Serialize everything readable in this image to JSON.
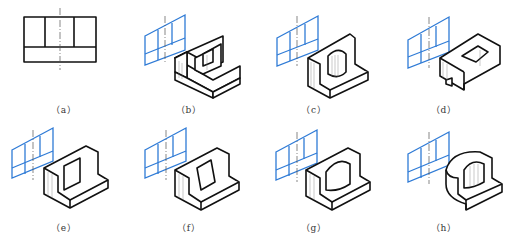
{
  "figure": {
    "panels": [
      {
        "id": "a",
        "label": "（a）",
        "description": "front view: rectangle with two vertical divisions on upper part and horizontal base band, vertical center line"
      },
      {
        "id": "b",
        "label": "（b）",
        "description": "L-shaped block with rectangular boss and step notch"
      },
      {
        "id": "c",
        "label": "（c）",
        "description": "L-shaped block with cylindrical boss"
      },
      {
        "id": "d",
        "label": "（d）",
        "description": "block with through slot and notch"
      },
      {
        "id": "e",
        "label": "（e）",
        "description": "L-shaped block with rectangular pocket"
      },
      {
        "id": "f",
        "label": "（f）",
        "description": "L-shaped block with inclined cut"
      },
      {
        "id": "g",
        "label": "（g）",
        "description": "L-shaped block with semicircular cutout"
      },
      {
        "id": "h",
        "label": "（h）",
        "description": "rounded block with semicircular cutout"
      }
    ],
    "colors": {
      "projection_lines": "#2f7bd6",
      "object_lines": "#111111",
      "center_line": "#555555"
    }
  }
}
